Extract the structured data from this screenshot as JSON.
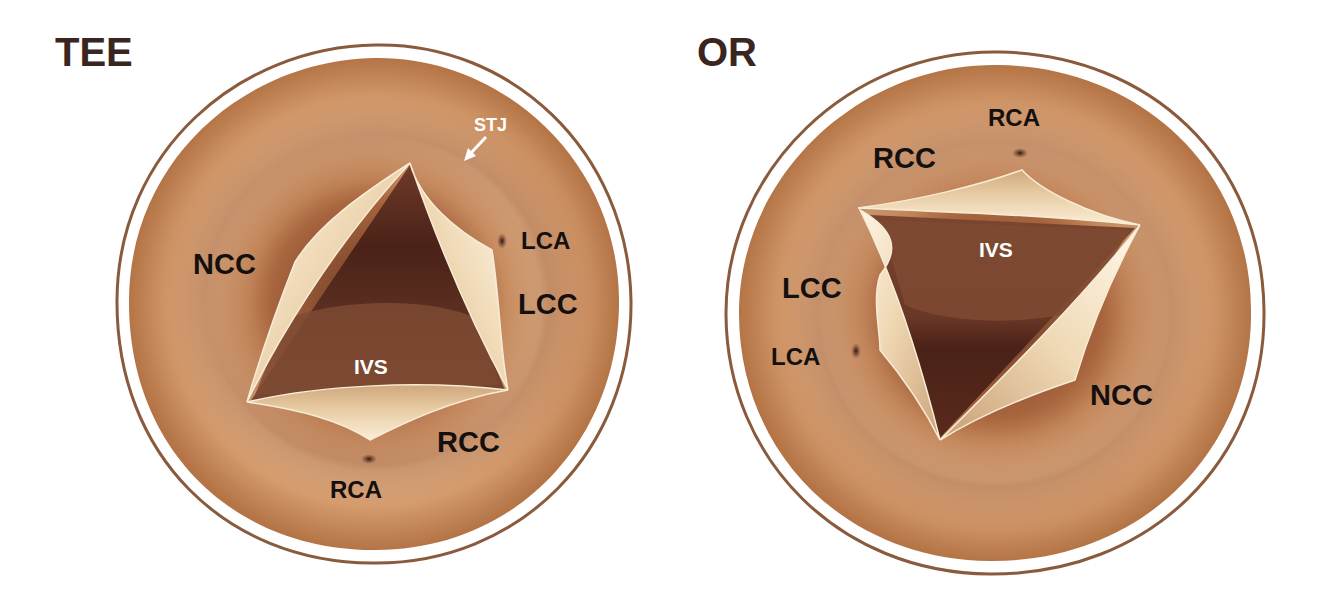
{
  "figure": {
    "colors": {
      "tissue_light": "#e8b88e",
      "tissue_mid": "#c98a5c",
      "tissue_dark": "#8a5030",
      "outline": "#8a5a3c",
      "leaflet": "#f0dcb8",
      "lumen_dark": "#4a2418",
      "title_text": "#3a2620",
      "label_text": "#141010",
      "label_white": "#ffffff"
    }
  },
  "panels": [
    {
      "id": "tee",
      "title": "TEE",
      "labels": {
        "stj": "STJ",
        "lca": "LCA",
        "ncc": "NCC",
        "lcc": "LCC",
        "ivs": "IVS",
        "rcc": "RCC",
        "rca": "RCA"
      }
    },
    {
      "id": "or",
      "title": "OR",
      "labels": {
        "rca": "RCA",
        "rcc": "RCC",
        "ivs": "IVS",
        "lcc": "LCC",
        "lca": "LCA",
        "ncc": "NCC"
      }
    }
  ]
}
